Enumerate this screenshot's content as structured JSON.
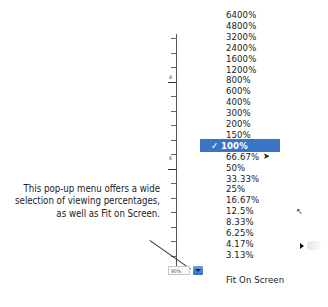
{
  "zoom_menu": {
    "items": [
      {
        "label": "6400%",
        "selected": false
      },
      {
        "label": "4800%",
        "selected": false
      },
      {
        "label": "3200%",
        "selected": false
      },
      {
        "label": "2400%",
        "selected": false
      },
      {
        "label": "1600%",
        "selected": false
      },
      {
        "label": "1200%",
        "selected": false
      },
      {
        "label": "800%",
        "selected": false
      },
      {
        "label": "600%",
        "selected": false
      },
      {
        "label": "400%",
        "selected": false
      },
      {
        "label": "300%",
        "selected": false
      },
      {
        "label": "200%",
        "selected": false
      },
      {
        "label": "150%",
        "selected": false
      },
      {
        "label": "100%",
        "selected": true
      },
      {
        "label": "66.67%",
        "selected": false
      },
      {
        "label": "50%",
        "selected": false
      },
      {
        "label": "33.33%",
        "selected": false
      },
      {
        "label": "25%",
        "selected": false
      },
      {
        "label": "16.67%",
        "selected": false
      },
      {
        "label": "12.5%",
        "selected": false
      },
      {
        "label": "8.33%",
        "selected": false
      },
      {
        "label": "6.25%",
        "selected": false
      },
      {
        "label": "4.17%",
        "selected": false
      },
      {
        "label": "3.13%",
        "selected": false
      }
    ],
    "fit_label": "Fit On Screen",
    "checkmark": "✓",
    "highlight_color": "#3a74c6"
  },
  "zoom_field": {
    "value": "90%"
  },
  "ruler": {
    "labels": [
      "4",
      "6"
    ]
  },
  "caption": {
    "line1": "This pop-up menu offers a wide",
    "line2": "selection of viewing percentages,",
    "line3": "as well as Fit on Screen."
  },
  "icons": {
    "cursor": "arrow-pointer-icon"
  }
}
